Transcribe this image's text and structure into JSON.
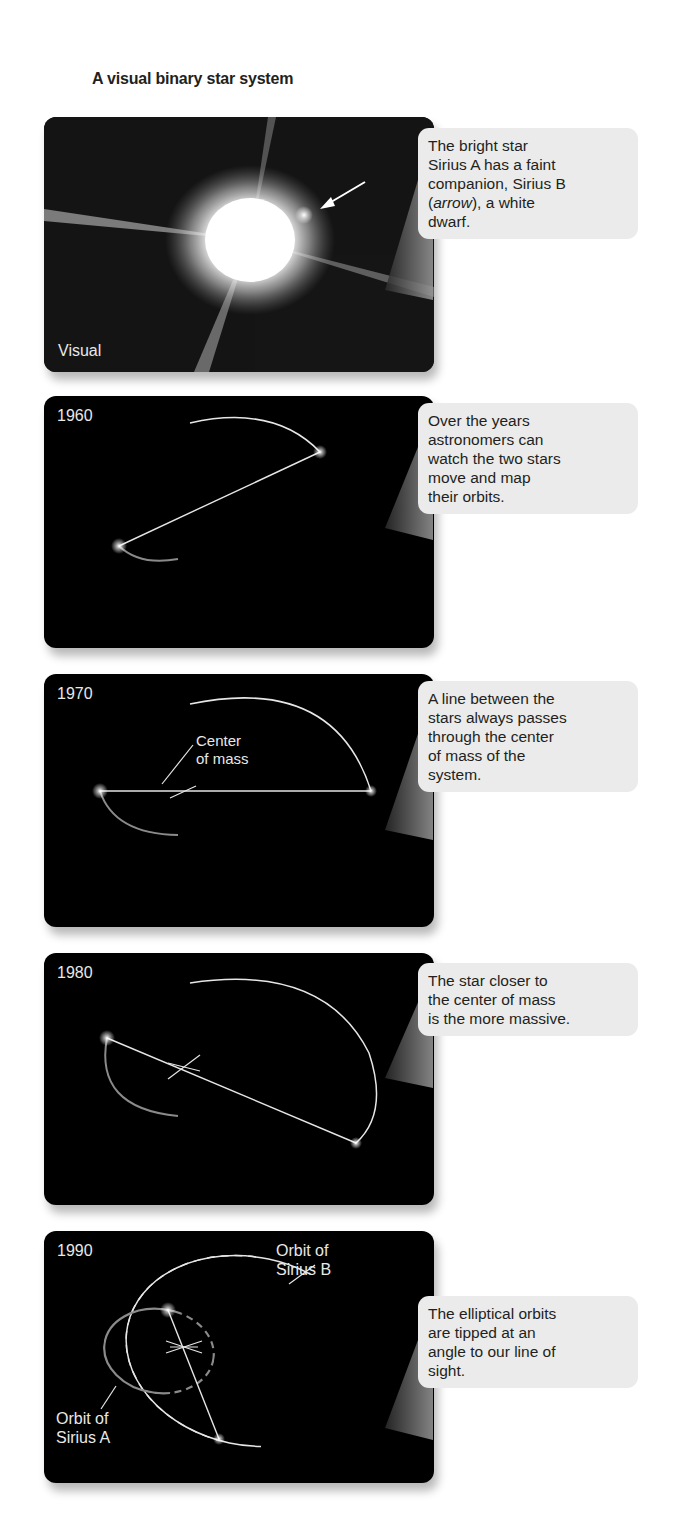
{
  "title": "A visual binary star system",
  "panels": [
    {
      "id": "visual",
      "label": "Visual",
      "callout": {
        "line1": "The bright star",
        "line2": "Sirius A has a faint",
        "line3": "companion, Sirius B",
        "line4_open": "(",
        "line4_em": "arrow",
        "line4_rest": "), a white",
        "line5": "dwarf."
      },
      "icons": [
        "arrow-icon"
      ]
    },
    {
      "id": "1960",
      "year": "1960",
      "callout": {
        "line1": "Over the years",
        "line2": "astronomers can",
        "line3": "watch the two stars",
        "line4": "move and map",
        "line5": "their orbits."
      }
    },
    {
      "id": "1970",
      "year": "1970",
      "diagram_label": {
        "line1": "Center",
        "line2": "of mass"
      },
      "callout": {
        "line1": "A line between the",
        "line2": "stars always passes",
        "line3": "through the center",
        "line4": "of mass of the",
        "line5": "system."
      }
    },
    {
      "id": "1980",
      "year": "1980",
      "callout": {
        "line1": "The star closer to",
        "line2": "the center of mass",
        "line3": "is the more massive."
      }
    },
    {
      "id": "1990",
      "year": "1990",
      "orbit_b_label": {
        "line1": "Orbit of",
        "line2": "Sirius B"
      },
      "orbit_a_label": {
        "line1": "Orbit of",
        "line2": "Sirius A"
      },
      "callout": {
        "line1": "The elliptical orbits",
        "line2": "are tipped at an",
        "line3": "angle to our line of",
        "line4": "sight."
      }
    }
  ],
  "colors": {
    "panel_bg": "#000000",
    "orbit_b": "#e6e6e6",
    "orbit_a": "#8a8a8a",
    "callout_bg": "#ebebeb",
    "text": "#231f20"
  }
}
